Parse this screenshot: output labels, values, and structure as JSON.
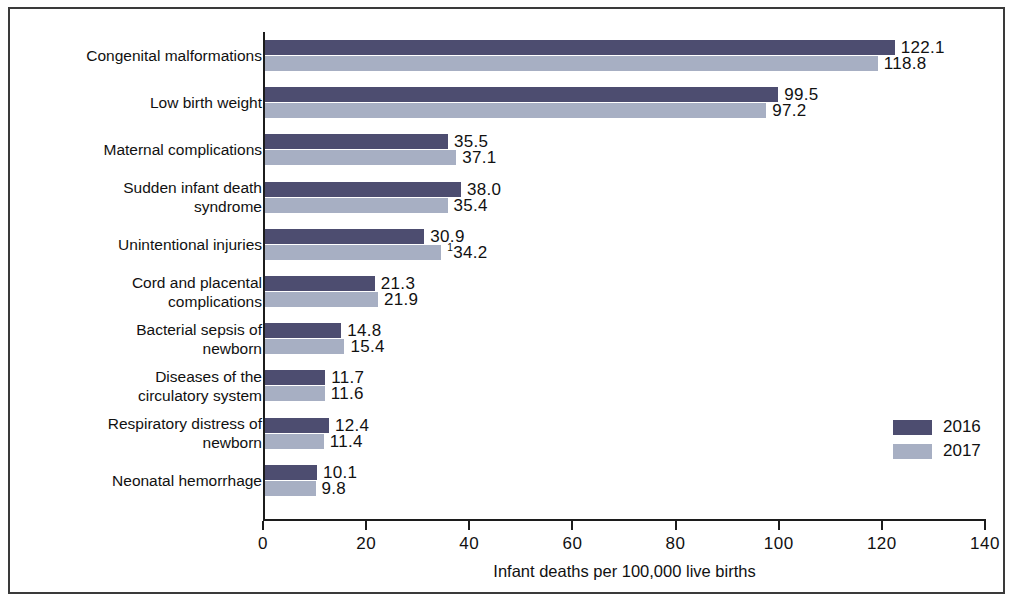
{
  "chart_data": {
    "type": "bar",
    "orientation": "horizontal",
    "title": "",
    "xlabel": "Infant deaths per 100,000 live births",
    "ylabel": "",
    "xlim": [
      0,
      140
    ],
    "xticks": [
      0,
      20,
      40,
      60,
      80,
      100,
      120,
      140
    ],
    "xtick_labels": [
      "0",
      "20",
      "40",
      "60",
      "80",
      "100",
      "120",
      "140"
    ],
    "grid": false,
    "legend_position": "right-inside",
    "categories": [
      "Congenital malformations",
      "Low birth weight",
      "Maternal complications",
      "Sudden infant death syndrome",
      "Unintentional injuries",
      "Cord and placental complications",
      "Bacterial sepsis of newborn",
      "Diseases of the circulatory system",
      "Respiratory distress of newborn",
      "Neonatal hemorrhage"
    ],
    "category_lines": [
      [
        "Congenital malformations"
      ],
      [
        "Low birth weight"
      ],
      [
        "Maternal complications"
      ],
      [
        "Sudden infant death",
        "syndrome"
      ],
      [
        "Unintentional injuries"
      ],
      [
        "Cord and placental",
        "complications"
      ],
      [
        "Bacterial sepsis of",
        "newborn"
      ],
      [
        "Diseases of the",
        "circulatory system"
      ],
      [
        "Respiratory distress of",
        "newborn"
      ],
      [
        "Neonatal hemorrhage"
      ]
    ],
    "series": [
      {
        "name": "2016",
        "color": "#4d4d70",
        "values": [
          122.1,
          99.5,
          35.5,
          38.0,
          30.9,
          21.3,
          14.8,
          11.7,
          12.4,
          10.1
        ],
        "labels": [
          "122.1",
          "99.5",
          "35.5",
          "38.0",
          "30.9",
          "21.3",
          "14.8",
          "11.7",
          "12.4",
          "10.1"
        ],
        "footnotes": [
          "",
          "",
          "",
          "",
          "",
          "",
          "",
          "",
          "",
          ""
        ]
      },
      {
        "name": "2017",
        "color": "#a7afc3",
        "values": [
          118.8,
          97.2,
          37.1,
          35.4,
          34.2,
          21.9,
          15.4,
          11.6,
          11.4,
          9.8
        ],
        "labels": [
          "118.8",
          "97.2",
          "37.1",
          "35.4",
          "34.2",
          "21.9",
          "15.4",
          "11.6",
          "11.4",
          "9.8"
        ],
        "footnotes": [
          "",
          "",
          "",
          "",
          "1",
          "",
          "",
          "",
          "",
          ""
        ]
      }
    ]
  },
  "legend": {
    "items": [
      {
        "label": "2016",
        "color": "#4d4d70"
      },
      {
        "label": "2017",
        "color": "#a7afc3"
      }
    ]
  }
}
